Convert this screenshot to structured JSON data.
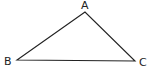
{
  "diagram": {
    "type": "triangle",
    "stroke_color": "#222222",
    "vertices": [
      {
        "label": "A",
        "x": 85,
        "y": 12,
        "label_x": 81,
        "label_y": 9
      },
      {
        "label": "B",
        "x": 17,
        "y": 60,
        "label_x": 4,
        "label_y": 65
      },
      {
        "label": "C",
        "x": 135,
        "y": 61,
        "label_x": 139,
        "label_y": 66
      }
    ]
  }
}
